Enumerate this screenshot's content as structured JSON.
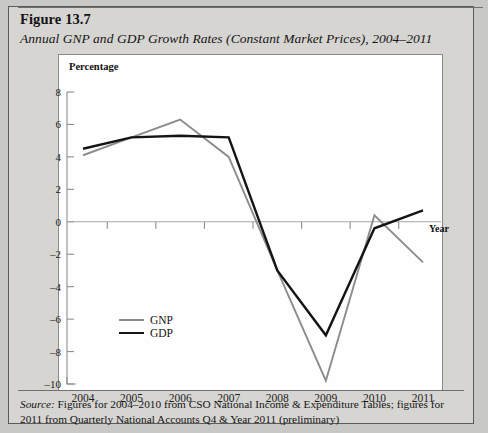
{
  "figure": {
    "number": "Figure 13.7",
    "subtitle": "Annual GNP and GDP Growth Rates (Constant Market Prices), 2004–2011",
    "source_label": "Source:",
    "source_text": " Figures for 2004–2010 from CSO National Income & Expenditure Tables; figures for 2011 from Quarterly National Accounts Q4 & Year 2011 (preliminary)"
  },
  "legend": {
    "items": [
      {
        "label": "GNP",
        "color": "#8c8c8c"
      },
      {
        "label": "GDP",
        "color": "#141414"
      }
    ]
  },
  "chart_data": {
    "type": "line",
    "title": "Annual GNP and GDP Growth Rates (Constant Market Prices), 2004–2011",
    "xlabel": "Year",
    "ylabel": "Percentage",
    "categories": [
      "2004",
      "2005",
      "2006",
      "2007",
      "2008",
      "2009",
      "2010",
      "2011"
    ],
    "x": [
      2004,
      2005,
      2006,
      2007,
      2008,
      2009,
      2010,
      2011
    ],
    "series": [
      {
        "name": "GNP",
        "color": "#8c8c8c",
        "values": [
          4.1,
          5.2,
          6.3,
          4.0,
          -3.0,
          -9.8,
          0.4,
          -2.5
        ]
      },
      {
        "name": "GDP",
        "color": "#141414",
        "values": [
          4.5,
          5.2,
          5.3,
          5.2,
          -3.0,
          -7.0,
          -0.4,
          0.7
        ]
      }
    ],
    "ylim": [
      -10,
      8
    ],
    "ytick_labels": [
      "8",
      "6",
      "4",
      "2",
      "0",
      "-2",
      "-4",
      "-6",
      "-8",
      "-10"
    ],
    "yticks": [
      8,
      6,
      4,
      2,
      0,
      -2,
      -4,
      -6,
      -8,
      -10
    ],
    "xtick_labels": [
      "2004",
      "2005",
      "2006",
      "2007",
      "2008",
      "2009",
      "2010",
      "2011"
    ],
    "grid": false,
    "legend_position": "inside-lower-left",
    "zero_line": true
  }
}
